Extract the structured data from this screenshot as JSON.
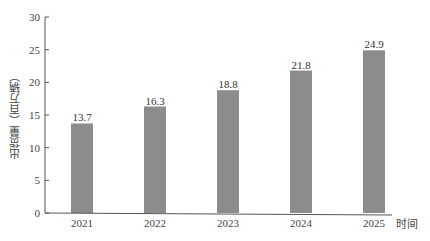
{
  "chart_data": {
    "type": "bar",
    "title": "",
    "xlabel": "时间",
    "ylabel": "出货量（百万辆）",
    "categories": [
      "2021",
      "2022",
      "2023",
      "2024",
      "2025"
    ],
    "values": [
      13.7,
      16.3,
      18.8,
      21.8,
      24.9
    ],
    "data_labels": [
      "13.7",
      "16.3",
      "18.8",
      "21.8",
      "24.9"
    ],
    "ylim": [
      0,
      30
    ],
    "yticks": [
      0,
      5,
      10,
      15,
      20,
      25,
      30
    ],
    "grid": false,
    "legend": null,
    "bar_color": "#8c8c8c"
  }
}
